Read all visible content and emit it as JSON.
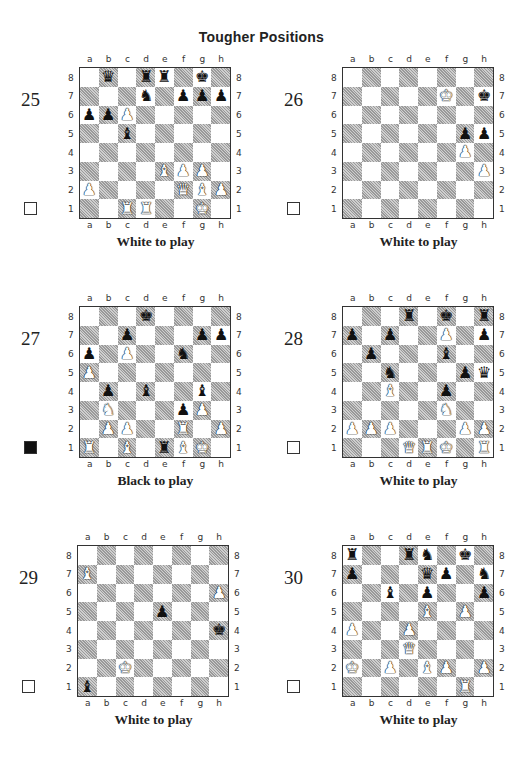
{
  "page": {
    "title": "Tougher Positions"
  },
  "legend": {
    "files": [
      "a",
      "b",
      "c",
      "d",
      "e",
      "f",
      "g",
      "h"
    ],
    "ranks": [
      "8",
      "7",
      "6",
      "5",
      "4",
      "3",
      "2",
      "1"
    ]
  },
  "colors": {
    "dark_square": "#cfcfcf",
    "border": "#333333",
    "text": "#222222"
  },
  "puzzles": [
    {
      "number": "25",
      "to_move": "White to play",
      "side_box": "white",
      "pieces": {
        "b8": "bQ",
        "d8": "bR",
        "e8": "bR",
        "g8": "bK",
        "d7": "bN",
        "f7": "bP",
        "g7": "bP",
        "h7": "bP",
        "a6": "bP",
        "b6": "bP",
        "c6": "wP",
        "c5": "bB",
        "e3": "wB",
        "f3": "wP",
        "g3": "wP",
        "a2": "wP",
        "f2": "wQ",
        "g2": "wB",
        "h2": "wP",
        "c1": "wR",
        "d1": "wR",
        "g1": "wK"
      }
    },
    {
      "number": "26",
      "to_move": "White to play",
      "side_box": "white",
      "pieces": {
        "f7": "wK",
        "h7": "bK",
        "g5": "bP",
        "h5": "bP",
        "g4": "wP",
        "h3": "wP"
      }
    },
    {
      "number": "27",
      "to_move": "Black to play",
      "side_box": "black",
      "pieces": {
        "d8": "bK",
        "c7": "bP",
        "g7": "bP",
        "h7": "bP",
        "a6": "bP",
        "c6": "wP",
        "f6": "bN",
        "a5": "wP",
        "b4": "bP",
        "d4": "bB",
        "g4": "bB",
        "b3": "wN",
        "f3": "bP",
        "g3": "wP",
        "b2": "wP",
        "c2": "wP",
        "f2": "wR",
        "h2": "wP",
        "a1": "wR",
        "c1": "wB",
        "e1": "bR",
        "f1": "wB",
        "g1": "wK"
      }
    },
    {
      "number": "28",
      "to_move": "White to play",
      "side_box": "white",
      "pieces": {
        "d8": "bR",
        "f8": "bK",
        "h8": "bR",
        "a7": "bP",
        "c7": "bP",
        "f7": "wP",
        "h7": "bP",
        "b6": "bP",
        "f6": "bB",
        "c5": "bN",
        "g5": "bP",
        "h5": "bQ",
        "c4": "wB",
        "f4": "bP",
        "f3": "wN",
        "a2": "wP",
        "b2": "wP",
        "c2": "wP",
        "g2": "wP",
        "h2": "wP",
        "d1": "wQ",
        "e1": "wR",
        "f1": "wK",
        "h1": "wR"
      }
    },
    {
      "number": "29",
      "to_move": "White to play",
      "side_box": "white",
      "pieces": {
        "a7": "wB",
        "h6": "wP",
        "e5": "bP",
        "h4": "bK",
        "c2": "wK",
        "a1": "bB"
      }
    },
    {
      "number": "30",
      "to_move": "White to play",
      "side_box": "white",
      "pieces": {
        "a8": "bR",
        "d8": "bR",
        "e8": "bN",
        "g8": "bK",
        "a7": "bP",
        "e7": "bQ",
        "f7": "bP",
        "h7": "bN",
        "c6": "bB",
        "e6": "bP",
        "h6": "bP",
        "e5": "wB",
        "g5": "wP",
        "a4": "wP",
        "d4": "wP",
        "d3": "wQ",
        "a2": "wK",
        "c2": "wP",
        "e2": "wB",
        "f2": "wP",
        "h2": "wP",
        "g1": "wR"
      }
    }
  ]
}
